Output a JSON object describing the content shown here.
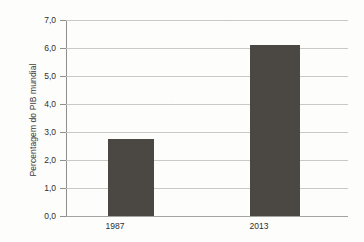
{
  "chart_data": {
    "type": "bar",
    "title": "",
    "subtitle": "",
    "xlabel": "",
    "ylabel": "Percentagem do PIB mundial",
    "categories": [
      "1987",
      "2013"
    ],
    "values": [
      2.75,
      6.1
    ],
    "ylim": [
      0.0,
      7.0
    ],
    "ytick_labels": [
      "7,0",
      "6,0",
      "5,0",
      "4,0",
      "3,0",
      "2,0",
      "1,0",
      "0,0"
    ],
    "ytick_values": [
      7.0,
      6.0,
      5.0,
      4.0,
      3.0,
      2.0,
      1.0,
      0.0
    ],
    "grid": true,
    "legend": false,
    "legend_position": "none",
    "bar_color": "#4b4844",
    "grid_color": "#c9c9c6",
    "axis_color": "#8f8f8c",
    "background_color": "#fdfdfb",
    "text_color": "#2f2f2d",
    "decimal_separator": ","
  }
}
